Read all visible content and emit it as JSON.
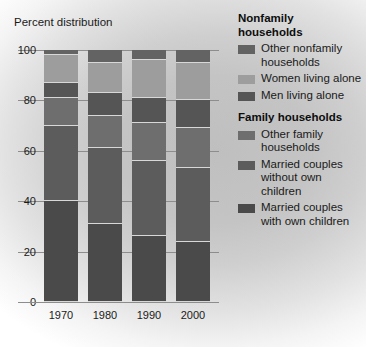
{
  "chart_data": {
    "type": "bar",
    "subtype": "stacked-percent",
    "title": "Percent distribution",
    "xlabel": "",
    "ylabel": "Percent distribution",
    "ylim": [
      0,
      100
    ],
    "yticks": [
      0,
      20,
      40,
      60,
      80,
      100
    ],
    "grid": true,
    "legend_position": "right",
    "categories": [
      "1970",
      "1980",
      "1990",
      "2000"
    ],
    "series": [
      {
        "name": "Married couples with own children",
        "group": "Family households",
        "color": "#4a4a4a",
        "values": [
          40,
          31,
          26,
          24
        ]
      },
      {
        "name": "Married couples without own children",
        "group": "Family households",
        "color": "#5c5c5c",
        "values": [
          30,
          30,
          30,
          29
        ]
      },
      {
        "name": "Other family households",
        "group": "Family households",
        "color": "#6e6e6e",
        "values": [
          11,
          13,
          15,
          16
        ]
      },
      {
        "name": "Men living alone",
        "group": "Nonfamily households",
        "color": "#555555",
        "values": [
          6,
          9,
          10,
          11
        ]
      },
      {
        "name": "Women living alone",
        "group": "Nonfamily households",
        "color": "#9d9d9d",
        "values": [
          11,
          12,
          15,
          15
        ]
      },
      {
        "name": "Other nonfamily households",
        "group": "Nonfamily households",
        "color": "#636363",
        "values": [
          2,
          5,
          4,
          5
        ]
      }
    ]
  },
  "yticks": [
    {
      "label": "100",
      "value": 100
    },
    {
      "label": "80",
      "value": 80
    },
    {
      "label": "60",
      "value": 60
    },
    {
      "label": "40",
      "value": 40
    },
    {
      "label": "20",
      "value": 20
    },
    {
      "label": "0",
      "value": 0
    }
  ],
  "bars": [
    {
      "label": "1970",
      "segments": [
        {
          "name": "Other nonfamily households",
          "from": 98,
          "to": 100,
          "color": "#636363"
        },
        {
          "name": "Women living alone",
          "from": 87,
          "to": 98,
          "color": "#9d9d9d"
        },
        {
          "name": "Men living alone",
          "from": 81,
          "to": 87,
          "color": "#555555"
        },
        {
          "name": "Other family households",
          "from": 70,
          "to": 81,
          "color": "#6e6e6e"
        },
        {
          "name": "Married couples without own children",
          "from": 40,
          "to": 70,
          "color": "#5c5c5c"
        },
        {
          "name": "Married couples with own children",
          "from": 0,
          "to": 40,
          "color": "#4a4a4a"
        }
      ]
    },
    {
      "label": "1980",
      "segments": [
        {
          "name": "Other nonfamily households",
          "from": 95,
          "to": 100,
          "color": "#636363"
        },
        {
          "name": "Women living alone",
          "from": 83,
          "to": 95,
          "color": "#9d9d9d"
        },
        {
          "name": "Men living alone",
          "from": 74,
          "to": 83,
          "color": "#555555"
        },
        {
          "name": "Other family households",
          "from": 61,
          "to": 74,
          "color": "#6e6e6e"
        },
        {
          "name": "Married couples without own children",
          "from": 31,
          "to": 61,
          "color": "#5c5c5c"
        },
        {
          "name": "Married couples with own children",
          "from": 0,
          "to": 31,
          "color": "#4a4a4a"
        }
      ]
    },
    {
      "label": "1990",
      "segments": [
        {
          "name": "Other nonfamily households",
          "from": 96,
          "to": 100,
          "color": "#636363"
        },
        {
          "name": "Women living alone",
          "from": 81,
          "to": 96,
          "color": "#9d9d9d"
        },
        {
          "name": "Men living alone",
          "from": 71,
          "to": 81,
          "color": "#555555"
        },
        {
          "name": "Other family households",
          "from": 56,
          "to": 71,
          "color": "#6e6e6e"
        },
        {
          "name": "Married couples without own children",
          "from": 26,
          "to": 56,
          "color": "#5c5c5c"
        },
        {
          "name": "Married couples with own children",
          "from": 0,
          "to": 26,
          "color": "#4a4a4a"
        }
      ]
    },
    {
      "label": "2000",
      "segments": [
        {
          "name": "Other nonfamily households",
          "from": 95,
          "to": 100,
          "color": "#636363"
        },
        {
          "name": "Women living alone",
          "from": 80,
          "to": 95,
          "color": "#9d9d9d"
        },
        {
          "name": "Men living alone",
          "from": 69,
          "to": 80,
          "color": "#555555"
        },
        {
          "name": "Other family households",
          "from": 53,
          "to": 69,
          "color": "#6e6e6e"
        },
        {
          "name": "Married couples without own children",
          "from": 24,
          "to": 53,
          "color": "#5c5c5c"
        },
        {
          "name": "Married couples with own children",
          "from": 0,
          "to": 24,
          "color": "#4a4a4a"
        }
      ]
    }
  ],
  "legend": {
    "nonfamily": {
      "title_line1": "Nonfamily",
      "title_line2": "households",
      "items": [
        {
          "label": "Other nonfamily households",
          "color": "#636363"
        },
        {
          "label": "Women living alone",
          "color": "#9d9d9d"
        },
        {
          "label": "Men living alone",
          "color": "#555555"
        }
      ]
    },
    "family": {
      "title_line1": "Family households",
      "items": [
        {
          "label": "Other family households",
          "color": "#6e6e6e"
        },
        {
          "label": "Married couples without own children",
          "color": "#5c5c5c"
        },
        {
          "label": "Married couples with own children",
          "color": "#4a4a4a"
        }
      ]
    }
  }
}
